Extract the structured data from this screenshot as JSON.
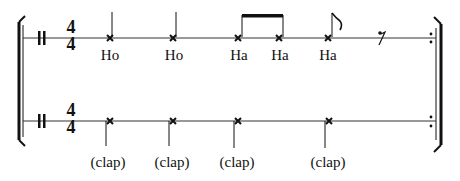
{
  "score": {
    "time_signature": {
      "numerator": "4",
      "denominator": "4"
    },
    "top_staff": {
      "notes": [
        {
          "x": 110,
          "label": "Ho",
          "type": "quarter"
        },
        {
          "x": 173,
          "label": "Ho",
          "type": "quarter"
        },
        {
          "x": 235,
          "label": "Ha",
          "type": "eighth-beamed"
        },
        {
          "x": 278,
          "label": "Ha",
          "type": "eighth-beamed"
        },
        {
          "x": 328,
          "label": "Ha",
          "type": "eighth-flag"
        }
      ],
      "rest": {
        "x": 382,
        "type": "eighth-rest"
      }
    },
    "bottom_staff": {
      "notes": [
        {
          "x": 110,
          "label": "(clap)"
        },
        {
          "x": 172,
          "label": "(clap)"
        },
        {
          "x": 237,
          "label": "(clap)"
        },
        {
          "x": 328,
          "label": "(clap)"
        }
      ]
    },
    "colors": {
      "ink": "#111111",
      "background": "#ffffff"
    }
  }
}
